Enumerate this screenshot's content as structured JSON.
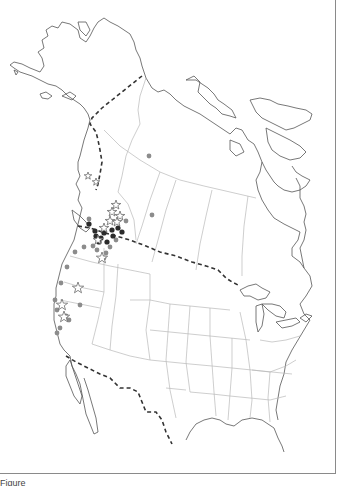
{
  "figure": {
    "type": "occurrence map",
    "region": "Western North America (Alaska, Canada, contiguous USA, northern Mexico)",
    "caption_visible": "Figure (caption cut off at bottom edge)",
    "caption_text": "Figure"
  },
  "legend": {
    "symbols": [
      {
        "shape": "circle",
        "fill": "#333333",
        "meaning": "dark filled circle"
      },
      {
        "shape": "circle",
        "fill": "#8c8c8c",
        "meaning": "grey filled circle"
      },
      {
        "shape": "star",
        "fill": "none",
        "stroke": "#666666",
        "meaning": "open star"
      }
    ]
  },
  "colors": {
    "coastline": "#555555",
    "admin_borders": "#b9b9b9",
    "international_border": "#333333",
    "dark_points": "#2b2b2b",
    "grey_points": "#8c8c8c",
    "stars": "#6b6b6b"
  },
  "points": {
    "dark": [
      [
        88,
        224
      ],
      [
        95,
        231
      ],
      [
        104,
        233
      ],
      [
        112,
        229
      ],
      [
        113,
        236
      ],
      [
        123,
        233
      ],
      [
        118,
        230
      ],
      [
        101,
        238
      ],
      [
        99,
        242
      ],
      [
        107,
        242
      ],
      [
        91,
        215
      ]
    ],
    "grey": [
      [
        152,
        215
      ],
      [
        149,
        156
      ],
      [
        146,
        218
      ],
      [
        126,
        221
      ],
      [
        89,
        219
      ],
      [
        84,
        247
      ],
      [
        75,
        252
      ],
      [
        67,
        267
      ],
      [
        61,
        283
      ],
      [
        55,
        300
      ],
      [
        53,
        320
      ],
      [
        58,
        318
      ],
      [
        67,
        320
      ],
      [
        60,
        328
      ],
      [
        65,
        325
      ],
      [
        57,
        336
      ],
      [
        80,
        305
      ],
      [
        110,
        247
      ],
      [
        97,
        250
      ],
      [
        116,
        240
      ],
      [
        106,
        253
      ]
    ],
    "stars": [
      [
        116,
        205
      ],
      [
        114,
        213
      ],
      [
        119,
        216
      ],
      [
        112,
        221
      ],
      [
        109,
        226
      ],
      [
        104,
        247
      ],
      [
        101,
        258
      ],
      [
        80,
        286
      ],
      [
        64,
        311
      ],
      [
        68,
        317
      ],
      [
        63,
        324
      ],
      [
        65,
        336
      ],
      [
        109,
        176
      ],
      [
        117,
        222
      ],
      [
        96,
        237
      ]
    ]
  }
}
